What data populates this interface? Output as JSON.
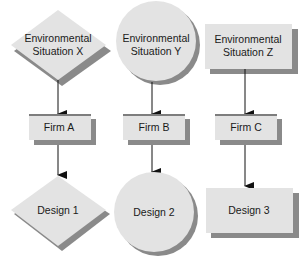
{
  "colors": {
    "fill": "#e3e3e3",
    "shadow": "#8a8a8a",
    "bar": "#7d7d7d",
    "arrow": "#111111"
  },
  "top_row": [
    {
      "shape": "diamond",
      "line1": "Environmental",
      "line2": "Situation X"
    },
    {
      "shape": "circle",
      "line1": "Environmental",
      "line2": "Situation Y"
    },
    {
      "shape": "rectangle",
      "line1": "Environmental",
      "line2": "Situation Z"
    }
  ],
  "firms": [
    {
      "label": "Firm A"
    },
    {
      "label": "Firm B"
    },
    {
      "label": "Firm C"
    }
  ],
  "designs": [
    {
      "shape": "diamond",
      "label": "Design 1"
    },
    {
      "shape": "circle",
      "label": "Design 2"
    },
    {
      "shape": "rectangle",
      "label": "Design 3"
    }
  ]
}
